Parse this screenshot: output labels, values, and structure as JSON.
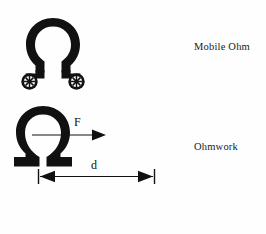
{
  "page": {
    "background_color": "#fefefe",
    "ink_color": "#111111",
    "width": 266,
    "height": 234
  },
  "figures": [
    {
      "id": "mobile-ohm",
      "symbol": "Ω",
      "symbol_name": "omega",
      "accessory": "cart-wheels",
      "wheel_count": 2,
      "wheel_spokes": 8,
      "caption": "Mobile Ohm"
    },
    {
      "id": "ohmwork",
      "symbol": "Ω",
      "symbol_name": "omega",
      "force_label": "F",
      "distance_label": "d",
      "caption": "Ohmwork"
    }
  ],
  "captions": {
    "mobile_ohm": "Mobile Ohm",
    "ohmwork": "Ohmwork"
  },
  "annotations": {
    "force": "F",
    "distance": "d"
  }
}
